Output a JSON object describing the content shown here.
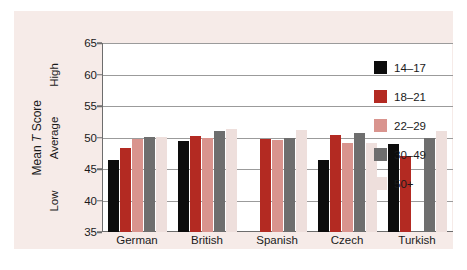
{
  "chart_data": {
    "type": "bar",
    "title": "",
    "subtitle": "",
    "xlabel": "",
    "ylabel": "Mean T Score",
    "ylabel_parts": {
      "pre": "Mean ",
      "italic": "T",
      "post": " Score"
    },
    "categories": [
      "German",
      "British",
      "Spanish",
      "Czech",
      "Turkish"
    ],
    "series": [
      {
        "name": "14–17",
        "color": "#0c0c0c",
        "values": [
          46.4,
          49.4,
          null,
          46.4,
          49.0
        ]
      },
      {
        "name": "18–21",
        "color": "#b32a22",
        "values": [
          48.3,
          50.2,
          49.8,
          50.4,
          47.1
        ]
      },
      {
        "name": "22–29",
        "color": "#d9948e",
        "values": [
          49.7,
          50.0,
          49.6,
          49.2,
          null
        ]
      },
      {
        "name": "30–49",
        "color": "#6e6e6e",
        "values": [
          50.1,
          51.1,
          50.0,
          50.7,
          50.0
        ]
      },
      {
        "name": "50+",
        "color": "#eedfdc",
        "values": [
          50.1,
          51.3,
          51.2,
          49.1,
          51.0
        ]
      }
    ],
    "ylim": [
      35,
      65
    ],
    "yticks": [
      35,
      40,
      45,
      50,
      55,
      60,
      65
    ],
    "ytick_labels": [
      "35",
      "40",
      "45",
      "50",
      "55",
      "60",
      "65"
    ],
    "zone_labels": [
      {
        "text": "Low",
        "value": 40
      },
      {
        "text": "Average",
        "value": 50
      },
      {
        "text": "High",
        "value": 60
      }
    ],
    "grid": true,
    "grid_axis": "y",
    "legend_position": "right",
    "legend_entries": [
      "14–17",
      "18–21",
      "22–29",
      "30–49",
      "50+"
    ],
    "colors": {
      "background": "#f6ebe8",
      "plot_background": "#ffffff",
      "axis": "#6d6d6d",
      "grid": "#9b9b9b",
      "text": "#1a1a1a"
    }
  }
}
